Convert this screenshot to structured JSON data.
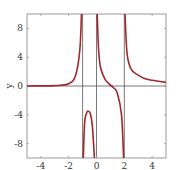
{
  "chart_data": {
    "type": "line",
    "title": "",
    "xlabel": "",
    "ylabel": "y",
    "xlim": [
      -5,
      5
    ],
    "ylim": [
      -10,
      10
    ],
    "xticks": [
      -4,
      -2,
      0,
      2,
      4
    ],
    "xtick_labels": [
      "-4",
      "-2",
      "0",
      "2",
      "4"
    ],
    "yticks": [
      8,
      4,
      0,
      -4,
      -8
    ],
    "ytick_labels": [
      "8",
      "4",
      "0",
      "-4",
      "-8"
    ],
    "grid": false,
    "reference_lines": {
      "vertical": [
        -1,
        0,
        2
      ],
      "horizontal": [
        0
      ]
    },
    "series": [
      {
        "name": "y",
        "color": "#a0282a",
        "description": "Rational function with vertical asymptotes at x=-1, x=0, x=2",
        "branches": [
          {
            "x_range": [
              -5,
              -1
            ],
            "points": [
              [
                -5,
                0.0
              ],
              [
                -4,
                0.02
              ],
              [
                -3,
                0.05
              ],
              [
                -2,
                0.3
              ],
              [
                -1.5,
                1.5
              ],
              [
                -1.2,
                5
              ],
              [
                -1.08,
                10
              ]
            ]
          },
          {
            "x_range": [
              -1,
              0
            ],
            "points": [
              [
                -0.95,
                -10
              ],
              [
                -0.85,
                -5
              ],
              [
                -0.7,
                -3.7
              ],
              [
                -0.6,
                -3.5
              ],
              [
                -0.45,
                -3.8
              ],
              [
                -0.3,
                -5.5
              ],
              [
                -0.15,
                -10
              ]
            ]
          },
          {
            "x_range": [
              0,
              2
            ],
            "points": [
              [
                0.05,
                10
              ],
              [
                0.15,
                5
              ],
              [
                0.3,
                2.5
              ],
              [
                0.6,
                1.0
              ],
              [
                0.9,
                0.3
              ],
              [
                1.2,
                -0.2
              ],
              [
                1.5,
                -1.0
              ],
              [
                1.8,
                -4
              ],
              [
                1.95,
                -10
              ]
            ]
          },
          {
            "x_range": [
              2,
              5
            ],
            "points": [
              [
                2.05,
                10
              ],
              [
                2.2,
                4.5
              ],
              [
                2.5,
                2.3
              ],
              [
                3,
                1.5
              ],
              [
                3.5,
                1.0
              ],
              [
                4,
                0.8
              ],
              [
                4.5,
                0.65
              ],
              [
                5,
                0.5
              ]
            ]
          }
        ]
      }
    ]
  },
  "colors": {
    "curve": "#a0282a",
    "frame": "#888888",
    "ref_lines": "#555555",
    "text": "#333333"
  }
}
